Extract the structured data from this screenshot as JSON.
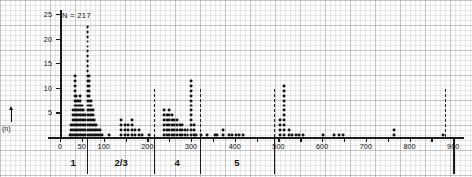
{
  "chart_data": {
    "type": "scatter",
    "plot_style": "dot-histogram",
    "title": "",
    "subtitle": "",
    "xlabel": "",
    "ylabel": "(n)",
    "annotation": "N = 217",
    "annotations": [
      "N = 217"
    ],
    "grid": true,
    "grid_style": "graph-paper",
    "legend": "none",
    "xlim": [
      0,
      920
    ],
    "ylim": [
      0,
      26
    ],
    "xticks": [
      0,
      50,
      100,
      150,
      200,
      250,
      300,
      350,
      400,
      450,
      500,
      550,
      600,
      650,
      700,
      750,
      800,
      850,
      900
    ],
    "xticklabels": [
      "0",
      "50",
      "100",
      "",
      "200",
      "",
      "300",
      "",
      "400",
      "",
      "500",
      "",
      "600",
      "",
      "700",
      "",
      "800",
      "",
      "900"
    ],
    "yticks": [
      5,
      10,
      15,
      20,
      25
    ],
    "yticklabels": [
      "5",
      "10",
      "15",
      "20",
      "25"
    ],
    "group_separators_dashed": [
      215,
      320,
      490,
      880
    ],
    "group_separators_solid": [
      62,
      215,
      320,
      490
    ],
    "groups": [
      {
        "label": "1",
        "center": 30
      },
      {
        "label": "2/3",
        "center": 140
      },
      {
        "label": "4",
        "center": 268
      },
      {
        "label": "5",
        "center": 405
      }
    ],
    "columns": [
      {
        "x": 22,
        "n": 1
      },
      {
        "x": 26,
        "n": 3
      },
      {
        "x": 30,
        "n": 6
      },
      {
        "x": 34,
        "n": 13
      },
      {
        "x": 38,
        "n": 9
      },
      {
        "x": 42,
        "n": 8
      },
      {
        "x": 46,
        "n": 9
      },
      {
        "x": 50,
        "n": 7
      },
      {
        "x": 54,
        "n": 6
      },
      {
        "x": 58,
        "n": 5
      },
      {
        "x": 63,
        "n": 23
      },
      {
        "x": 67,
        "n": 13
      },
      {
        "x": 71,
        "n": 8
      },
      {
        "x": 75,
        "n": 6
      },
      {
        "x": 79,
        "n": 4
      },
      {
        "x": 83,
        "n": 3
      },
      {
        "x": 87,
        "n": 2
      },
      {
        "x": 91,
        "n": 2
      },
      {
        "x": 96,
        "n": 1
      },
      {
        "x": 112,
        "n": 1
      },
      {
        "x": 140,
        "n": 4
      },
      {
        "x": 148,
        "n": 3
      },
      {
        "x": 156,
        "n": 3
      },
      {
        "x": 164,
        "n": 4
      },
      {
        "x": 172,
        "n": 2
      },
      {
        "x": 180,
        "n": 2
      },
      {
        "x": 188,
        "n": 1
      },
      {
        "x": 204,
        "n": 1
      },
      {
        "x": 238,
        "n": 6
      },
      {
        "x": 244,
        "n": 5
      },
      {
        "x": 250,
        "n": 6
      },
      {
        "x": 256,
        "n": 5
      },
      {
        "x": 262,
        "n": 4
      },
      {
        "x": 268,
        "n": 4
      },
      {
        "x": 274,
        "n": 3
      },
      {
        "x": 280,
        "n": 3
      },
      {
        "x": 286,
        "n": 2
      },
      {
        "x": 292,
        "n": 2
      },
      {
        "x": 300,
        "n": 12
      },
      {
        "x": 306,
        "n": 3
      },
      {
        "x": 312,
        "n": 1
      },
      {
        "x": 322,
        "n": 1
      },
      {
        "x": 336,
        "n": 1
      },
      {
        "x": 354,
        "n": 1
      },
      {
        "x": 360,
        "n": 1
      },
      {
        "x": 374,
        "n": 2
      },
      {
        "x": 386,
        "n": 1
      },
      {
        "x": 394,
        "n": 1
      },
      {
        "x": 402,
        "n": 1
      },
      {
        "x": 410,
        "n": 1
      },
      {
        "x": 418,
        "n": 1
      },
      {
        "x": 504,
        "n": 4
      },
      {
        "x": 512,
        "n": 11
      },
      {
        "x": 524,
        "n": 2
      },
      {
        "x": 532,
        "n": 1
      },
      {
        "x": 540,
        "n": 1
      },
      {
        "x": 548,
        "n": 1
      },
      {
        "x": 556,
        "n": 1
      },
      {
        "x": 602,
        "n": 1
      },
      {
        "x": 628,
        "n": 1
      },
      {
        "x": 638,
        "n": 1
      },
      {
        "x": 648,
        "n": 1
      },
      {
        "x": 764,
        "n": 2
      },
      {
        "x": 876,
        "n": 1
      }
    ]
  }
}
